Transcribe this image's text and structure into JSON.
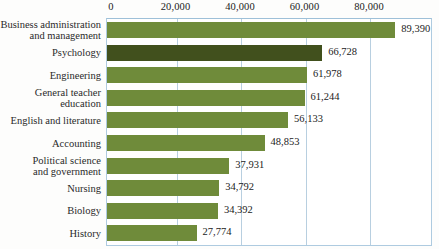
{
  "chart_data": {
    "type": "bar",
    "orientation": "horizontal",
    "title": "",
    "xlabel": "",
    "ylabel": "",
    "xlim": [
      0,
      90000
    ],
    "ticks": [
      0,
      20000,
      40000,
      60000,
      80000
    ],
    "tick_labels": [
      "0",
      "20,000",
      "40,000",
      "60,000",
      "80,000"
    ],
    "grid": "vertical",
    "legend": "none",
    "bar_color": "#6f8b3a",
    "highlight_color": "#41501d",
    "gridline_color": "#b8cfe0",
    "categories": [
      "Business administration\nand management",
      "Psychology",
      "Engineering",
      "General teacher\neducation",
      "English and literature",
      "Accounting",
      "Political science\nand government",
      "Nursing",
      "Biology",
      "History"
    ],
    "values": [
      89390,
      66728,
      61978,
      61244,
      56133,
      48853,
      37931,
      34792,
      34392,
      27774
    ],
    "value_labels": [
      "89,390",
      "66,728",
      "61,978",
      "61,244",
      "56,133",
      "48,853",
      "37,931",
      "34,792",
      "34,392",
      "27,774"
    ],
    "highlighted_index": 1
  }
}
